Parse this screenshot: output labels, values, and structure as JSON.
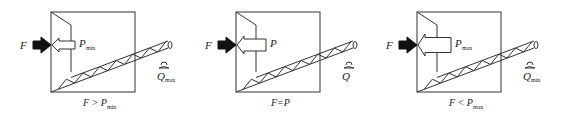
{
  "diagram": {
    "panels": [
      {
        "id": "panel-1",
        "force_label": "F",
        "pressure_label": "P",
        "pressure_sub": "min",
        "flow_label": "Q",
        "flow_sub": "max",
        "caption_lhs": "F",
        "caption_op": ">",
        "caption_rhs": "P",
        "caption_sub": "min",
        "pressure_arrow_size": "small"
      },
      {
        "id": "panel-2",
        "force_label": "F",
        "pressure_label": "P",
        "pressure_sub": "",
        "flow_label": "Q",
        "flow_sub": "",
        "caption_lhs": "F",
        "caption_op": "=",
        "caption_rhs": "P",
        "caption_sub": "",
        "pressure_arrow_size": "medium"
      },
      {
        "id": "panel-3",
        "force_label": "F",
        "pressure_label": "P",
        "pressure_sub": "max",
        "flow_label": "Q",
        "flow_sub": "min",
        "caption_lhs": "F",
        "caption_op": "<",
        "caption_rhs": "P",
        "caption_sub": "max",
        "pressure_arrow_size": "large"
      }
    ],
    "colors": {
      "line": "#333333",
      "force_arrow": "#111111",
      "pressure_arrow_fill": "#ffffff"
    }
  }
}
